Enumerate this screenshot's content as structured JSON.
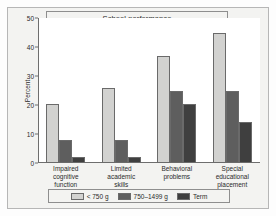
{
  "figure": {
    "title": "School performance",
    "background_color": "#f3f3f1",
    "plot_background_color": "#ffffff",
    "border_color": "#b6b6b6"
  },
  "chart_data": {
    "type": "bar",
    "title": "School performance",
    "xlabel": "",
    "ylabel": "Percent",
    "ylim": [
      0,
      50
    ],
    "yticks": [
      0,
      10,
      20,
      30,
      40,
      50
    ],
    "ytick_labels": [
      "0",
      "10",
      "20",
      "30",
      "40",
      "50"
    ],
    "grid": false,
    "legend_position": "bottom",
    "categories": [
      "Impaired cognitive function",
      "Limited academic skills",
      "Behavioral problems",
      "Special educational placement"
    ],
    "category_lines": [
      [
        "Impaired",
        "cognitive",
        "function"
      ],
      [
        "Limited",
        "academic",
        "skills"
      ],
      [
        "Behavioral",
        "problems"
      ],
      [
        "Special",
        "educational",
        "placement"
      ]
    ],
    "series": [
      {
        "name": "< 750 g",
        "color": "#d2d2d0",
        "values": [
          20.5,
          26.0,
          37.0,
          45.0
        ]
      },
      {
        "name": "750–1499 g",
        "color": "#5e5e5e",
        "values": [
          8.0,
          8.0,
          25.0,
          25.0
        ]
      },
      {
        "name": "Term",
        "color": "#3f3f3f",
        "values": [
          2.0,
          2.0,
          20.5,
          14.0
        ]
      }
    ]
  },
  "legend": {
    "items": [
      {
        "label": "< 750 g"
      },
      {
        "label": "750–1499 g"
      },
      {
        "label": "Term"
      }
    ]
  }
}
